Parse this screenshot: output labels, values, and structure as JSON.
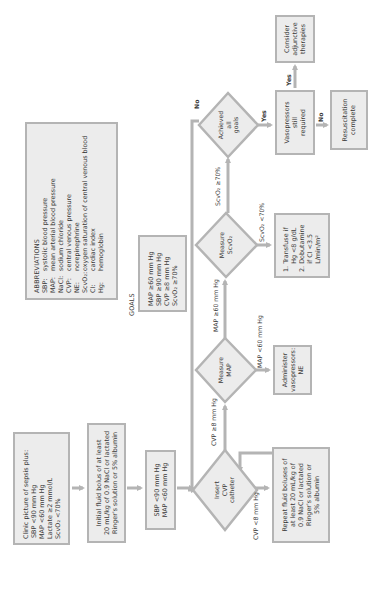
{
  "nodes": {
    "clinic": {
      "lines": [
        "Clinic picture of sepsis plus:",
        "SBP <90 mm Hg",
        "MAP <60  mm Hg",
        "Lactate ≥2 mmol/L",
        "ScvO₂ <70%"
      ]
    },
    "initial_fluid": {
      "lines": [
        "Initial fluid bolus of at least",
        "20 mL/kg of 0.9 NaCl or lactated",
        "Ringer's solution or 5% albumin"
      ]
    },
    "sbp_check": {
      "lines": [
        "SBP <90 mm Hg",
        "MAP <60 mm Hg"
      ]
    },
    "insert_cvp": {
      "lines": [
        "Insert",
        "CVP",
        "catheter"
      ]
    },
    "repeat_fluid": {
      "lines": [
        "Repeat fluid boluses of",
        "at least 20 mL/kg of",
        "0.9 NaCl or lactated",
        "Ringer's solution or",
        "5% albumin"
      ]
    },
    "measure_map": {
      "lines": [
        "Measure",
        "MAP"
      ]
    },
    "administer": {
      "lines": [
        "Administer",
        "vasopressors:",
        "NE"
      ]
    },
    "measure_scvo2": {
      "lines": [
        "Measure",
        "ScvO₂"
      ]
    },
    "transfuse": {
      "lines": [
        "1. Transfuse if",
        "    Hg <8 g/dL",
        "2. Dobutamine",
        "    if CI <3.5",
        "    L/min/m²"
      ]
    },
    "achieved": {
      "lines": [
        "Achieved",
        "all",
        "goals"
      ]
    },
    "vasopressors_required": {
      "lines": [
        "Vasopressors",
        "still",
        "required"
      ]
    },
    "resuscitation_complete": {
      "lines": [
        "Resuscitation",
        "complete"
      ]
    },
    "adjunctive": {
      "lines": [
        "Consider",
        "adjunctive",
        "therapies"
      ]
    }
  },
  "edge_labels": {
    "cvp_high": "CVP ≥8 mm Hg",
    "cvp_low": "CVP <8 mm Hg",
    "map_high": "MAP ≥60 mm Hg",
    "map_low": "MAP <60 mm Hg",
    "scvo2_high": "ScvO₂ ≥70%",
    "scvo2_low": "ScvO₂ <70%",
    "achieved_yes": "Yes",
    "achieved_no": "No",
    "vaso_yes": "Yes",
    "vaso_no": "No"
  },
  "abbreviations": {
    "title": "ABBREVIATIONS",
    "items": [
      {
        "key": "SBP:",
        "value": "systolic blood pressure"
      },
      {
        "key": "MAP:",
        "value": "mean arterial blood pressure"
      },
      {
        "key": "NaCl:",
        "value": "sodium chloride"
      },
      {
        "key": "CVP:",
        "value": "central venous pressure"
      },
      {
        "key": "NE:",
        "value": "norepinephrine"
      },
      {
        "key": "ScvO₂:",
        "value": "oxygen saturation of central venous blood"
      },
      {
        "key": "CI:",
        "value": "cardiac index"
      },
      {
        "key": "Hg:",
        "value": "hemoglobin"
      }
    ]
  },
  "goals": {
    "title": "GOALS",
    "lines": [
      "MAP ≥60 mm Hg",
      "SBP ≥90 mm Hg",
      "CVP ≥8 mm Hg",
      "ScvO₂ ≥70%"
    ]
  },
  "colors": {
    "box_fill": "#ececec",
    "box_border": "#b4b4b4",
    "arrow": "#b4b4b4",
    "text": "#3a3a3a"
  }
}
